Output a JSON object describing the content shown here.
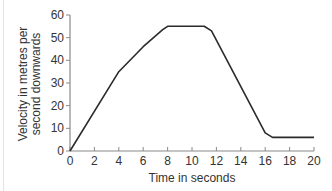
{
  "chart_data": {
    "type": "line",
    "title": "",
    "xlabel": "Time in seconds",
    "ylabel_lines": [
      "Velocity in metres per",
      "second downwards"
    ],
    "ylabel": "Velocity in metres per second downwards",
    "xlim": [
      0,
      20
    ],
    "ylim": [
      0,
      60
    ],
    "x_ticks": [
      "0",
      "2",
      "4",
      "6",
      "8",
      "10",
      "12",
      "14",
      "16",
      "18",
      "20"
    ],
    "y_ticks": [
      "0",
      "10",
      "20",
      "30",
      "40",
      "50",
      "60"
    ],
    "grid": false,
    "legend": null,
    "series": [
      {
        "name": "Velocity",
        "x": [
          0,
          4,
          6,
          7.6,
          8,
          11,
          11.6,
          16,
          16.6,
          20
        ],
        "values": [
          0,
          35,
          46,
          53.5,
          55,
          55,
          53,
          8,
          6,
          6
        ]
      }
    ],
    "line_color": "#2b2b2b",
    "axis_color": "#8a8a8a"
  }
}
